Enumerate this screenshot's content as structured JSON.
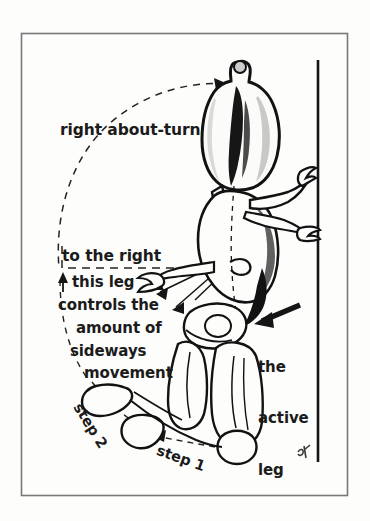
{
  "figure": {
    "kind": "scanned-book-illustration",
    "background_color": "#fdfdfc",
    "ink_color": "#1b1b1b",
    "frame": {
      "name": "illustration-border",
      "stroke_color": "#6e6e6e",
      "x": 21,
      "y": 33,
      "width": 327,
      "height": 463
    },
    "reference_line": {
      "name": "vertical-reference-line",
      "color": "#141414",
      "x": 318,
      "y_top": 60,
      "y_bottom": 462
    },
    "signature": {
      "text": "SK",
      "x": 298,
      "y": 452
    }
  },
  "labels": {
    "right_about_turn": "right about-turn",
    "to_the_right": "to the right",
    "this_leg": "this leg",
    "controls_the": "controls the",
    "amount_of": "amount of",
    "sideways": "sideways",
    "movement": "movement",
    "the": "the",
    "active": "active",
    "leg": "leg",
    "step_1": "step 1",
    "step_2": "step 2"
  },
  "annotation_order": [
    "right about-turn",
    "to the right",
    "this leg",
    "controls the",
    "amount of",
    "sideways",
    "movement",
    "the active leg",
    "step 2",
    "step 1"
  ]
}
